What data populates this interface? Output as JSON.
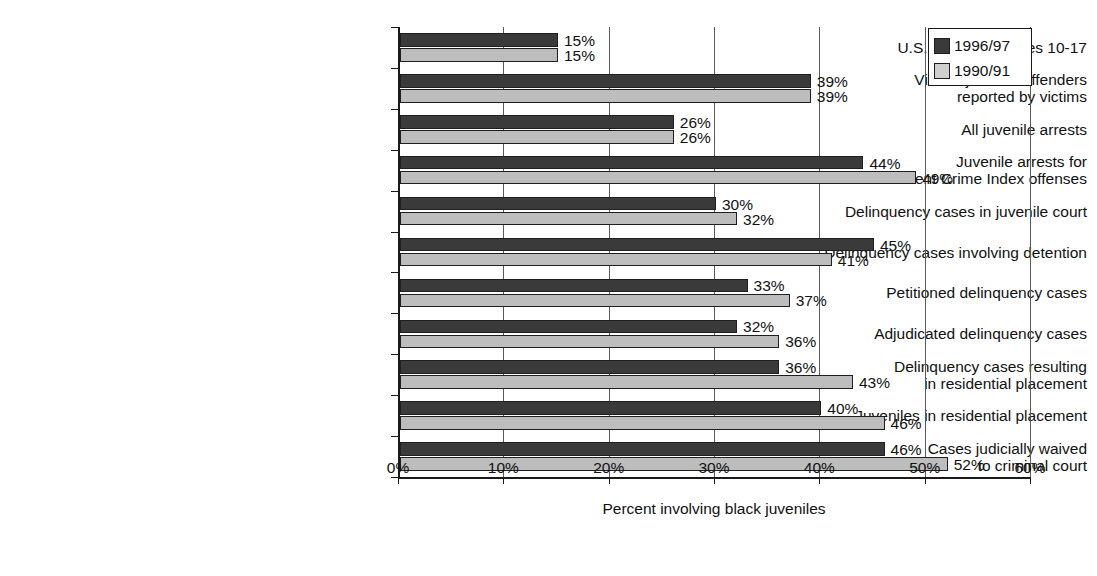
{
  "chart_data": {
    "type": "bar",
    "orientation": "horizontal",
    "title": "",
    "xlabel": "Percent involving black juveniles",
    "ylabel": "",
    "xlim": [
      0,
      60
    ],
    "xticks": [
      "0%",
      "10%",
      "20%",
      "30%",
      "40%",
      "50%",
      "60%"
    ],
    "xtick_values": [
      0,
      10,
      20,
      30,
      40,
      50,
      60
    ],
    "grid": true,
    "grid_axis": "x",
    "legend_position": "top-right",
    "categories": [
      "U.S. Population ages 10-17",
      "Violent juvenile offenders\nreported by victims",
      "All juvenile arrests",
      "Juvenile arrests for\nViolent Crime Index offenses",
      "Delinquency cases in juvenile court",
      "Delinquency cases involving detention",
      "Petitioned delinquency cases",
      "Adjudicated delinquency cases",
      "Delinquency cases resulting\nin residential placement",
      "Juveniles in residential placement",
      "Cases judicially waived\nto criminal court"
    ],
    "series": [
      {
        "name": "1996/97",
        "color": "#3a3a3a",
        "values": [
          15,
          39,
          26,
          44,
          30,
          45,
          33,
          32,
          36,
          40,
          46
        ],
        "labels": [
          "15%",
          "39%",
          "26%",
          "44%",
          "30%",
          "45%",
          "33%",
          "32%",
          "36%",
          "40%",
          "46%"
        ]
      },
      {
        "name": "1990/91",
        "color": "#bdbdbd",
        "values": [
          15,
          39,
          26,
          49,
          32,
          41,
          37,
          36,
          43,
          46,
          52
        ],
        "labels": [
          "15%",
          "39%",
          "26%",
          "49%",
          "32%",
          "41%",
          "37%",
          "36%",
          "43%",
          "46%",
          "52%"
        ]
      }
    ]
  },
  "legend": {
    "items": [
      {
        "label": "1996/97",
        "swatch": "dark-square-icon"
      },
      {
        "label": "1990/91",
        "swatch": "light-square-icon"
      }
    ]
  },
  "axis": {
    "x_title": "Percent involving black juveniles"
  }
}
